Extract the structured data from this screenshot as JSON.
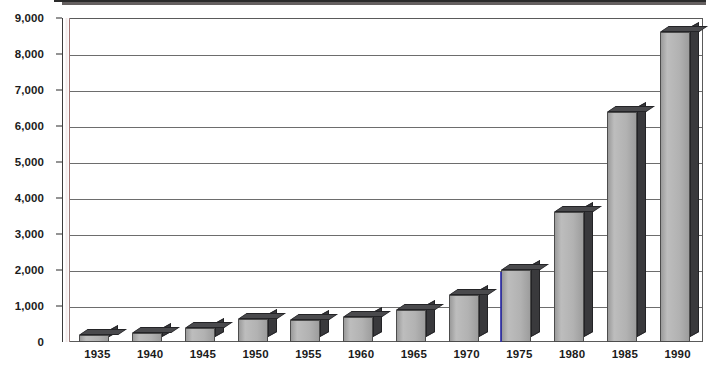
{
  "chart_data": {
    "type": "bar",
    "title": "",
    "subtitle": "",
    "xlabel": "",
    "ylabel": "",
    "categories": [
      "1935",
      "1940",
      "1945",
      "1950",
      "1955",
      "1960",
      "1965",
      "1970",
      "1975",
      "1980",
      "1985",
      "1990"
    ],
    "values": [
      200,
      250,
      400,
      650,
      600,
      700,
      900,
      1300,
      2000,
      3600,
      6400,
      8600
    ],
    "series": [
      {
        "name": "",
        "values": [
          200,
          250,
          400,
          650,
          600,
          700,
          900,
          1300,
          2000,
          3600,
          6400,
          8600
        ]
      }
    ],
    "ylim": [
      0,
      9000
    ],
    "ytick_values": [
      0,
      1000,
      2000,
      3000,
      4000,
      5000,
      6000,
      7000,
      8000,
      9000
    ],
    "ytick_labels": [
      "0",
      "1,000",
      "2,000",
      "3,000",
      "4,000",
      "5,000",
      "6,000",
      "7,000",
      "8,000",
      "9,000"
    ],
    "grid": true,
    "grid_axis": "y",
    "legend": false,
    "legend_position": "none",
    "bar_style": "3d-column",
    "colors": {
      "bar_front": "#b2b2b2",
      "bar_side": "#39393c",
      "bar_top": "#4a4a4d",
      "gridline": "#6d6d6d",
      "axis": "#2b2b2b",
      "label_text": "#1b1b1b",
      "background": "#ffffff"
    }
  }
}
